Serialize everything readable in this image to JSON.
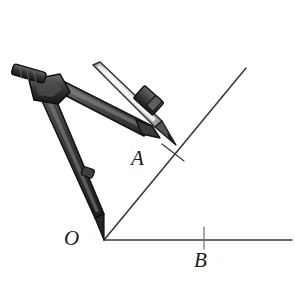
{
  "figure": {
    "type": "geometric-construction",
    "background_color": "#ffffff",
    "width": 295,
    "height": 288,
    "ink_color": "#333333",
    "labels": [
      {
        "id": "O",
        "text": "O",
        "role": "angle-vertex",
        "x": 64,
        "y": 228
      },
      {
        "id": "A",
        "text": "A",
        "role": "point-on-upper-ray",
        "x": 131,
        "y": 148
      },
      {
        "id": "B",
        "text": "B",
        "role": "point-on-lower-ray",
        "x": 194,
        "y": 250
      }
    ],
    "rays": [
      {
        "id": "upper-ray",
        "from": {
          "x": 104,
          "y": 240
        },
        "to": {
          "x": 246,
          "y": 68
        },
        "stroke": "#3a3a3a",
        "width": 1.6
      },
      {
        "id": "lower-ray",
        "from": {
          "x": 104,
          "y": 240
        },
        "to": {
          "x": 291,
          "y": 240
        },
        "stroke": "#3a3a3a",
        "width": 1.6
      }
    ],
    "tick_marks": [
      {
        "id": "tick-at-A",
        "on_ray": "upper-ray",
        "from": {
          "x": 163,
          "y": 145
        },
        "to": {
          "x": 183,
          "y": 160
        },
        "stroke": "#3a3a3a",
        "width": 1.2
      },
      {
        "id": "tick-at-B",
        "on_ray": "lower-ray",
        "from": {
          "x": 204,
          "y": 228
        },
        "to": {
          "x": 204,
          "y": 248
        },
        "stroke": "#6a6a6a",
        "width": 1.2
      }
    ],
    "compass": {
      "name": "drawing-compass",
      "colors": {
        "body_dark": "#2e2e2e",
        "body_mid": "#4a4a4a",
        "body_light": "#6e6e6e",
        "outline": "#151515",
        "pencil_body": "#e9e9e9",
        "pencil_edge": "#8f8f8f",
        "pencil_tip": "#4a4a4a"
      },
      "parts": [
        {
          "id": "top-handle",
          "label": "knurled handle"
        },
        {
          "id": "hinge",
          "label": "pivot hinge"
        },
        {
          "id": "needle-leg",
          "label": "needle leg"
        },
        {
          "id": "needle-point",
          "label": "needle point at O"
        },
        {
          "id": "adjust-knob",
          "label": "adjustment knob"
        },
        {
          "id": "pencil-leg",
          "label": "pencil leg"
        },
        {
          "id": "pencil-clamp",
          "label": "pencil clamp"
        },
        {
          "id": "pencil",
          "label": "pencil"
        },
        {
          "id": "pencil-tip",
          "label": "pencil tip at A"
        }
      ]
    }
  }
}
